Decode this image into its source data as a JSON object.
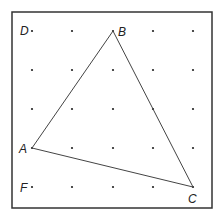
{
  "diagram": {
    "type": "geoboard-triangle",
    "grid": {
      "columns": 5,
      "rows": 5,
      "x": [
        32,
        72,
        113,
        153,
        193
      ],
      "y": [
        31,
        70,
        109,
        148,
        187
      ]
    },
    "frame": {
      "x": 12,
      "y": 12,
      "width": 200,
      "height": 196,
      "color": "#333333"
    },
    "points": {
      "A": {
        "label": "A",
        "x": 32,
        "y": 148
      },
      "B": {
        "label": "B",
        "x": 113,
        "y": 31
      },
      "C": {
        "label": "C",
        "x": 193,
        "y": 187
      },
      "D": {
        "label": "D",
        "x": 32,
        "y": 31
      },
      "F": {
        "label": "F",
        "x": 32,
        "y": 187
      }
    },
    "triangle": [
      "A",
      "B",
      "C"
    ],
    "line_color": "#444444",
    "dot_color": "#222222"
  }
}
